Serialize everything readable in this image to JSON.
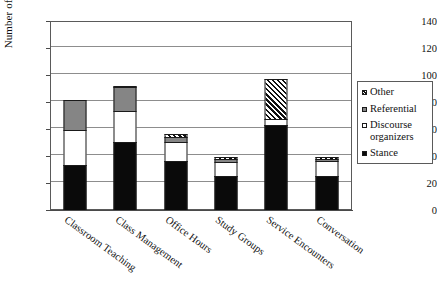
{
  "chart_data": {
    "type": "bar",
    "stacked": true,
    "title": "",
    "xlabel": "",
    "ylabel": "Number of bundles",
    "ylim": [
      0,
      140
    ],
    "yticks": [
      0,
      20,
      40,
      60,
      80,
      100,
      120,
      140
    ],
    "grid": true,
    "legend_position": "right",
    "categories": [
      "Classroom Teaching",
      "Class Management",
      "Office Hours",
      "Study Groups",
      "Service Encounters",
      "Conversation"
    ],
    "series": [
      {
        "name": "Stance",
        "color": "#0a0a0a",
        "pattern": "solid-black",
        "values": [
          34,
          51,
          37,
          26,
          64,
          26
        ]
      },
      {
        "name": "Discourse organizers",
        "color": "#ffffff",
        "pattern": "solid-white",
        "values": [
          27,
          24,
          15,
          11,
          5,
          12
        ]
      },
      {
        "name": "Referential",
        "color": "#858585",
        "pattern": "solid-gray",
        "values": [
          23,
          18,
          4,
          3,
          0,
          2
        ]
      },
      {
        "name": "Other",
        "color": "#111111",
        "pattern": "diagonal-hatch",
        "values": [
          0,
          2,
          3,
          2,
          30,
          2
        ]
      }
    ],
    "totals": [
      84,
      95,
      59,
      42,
      99,
      42
    ]
  },
  "legend": {
    "items": [
      {
        "label": "Other",
        "swatch": "diagonal-hatch"
      },
      {
        "label": "Referential",
        "swatch": "solid-gray"
      },
      {
        "label": "Discourse organizers",
        "swatch": "solid-white"
      },
      {
        "label": "Stance",
        "swatch": "solid-black"
      }
    ]
  }
}
